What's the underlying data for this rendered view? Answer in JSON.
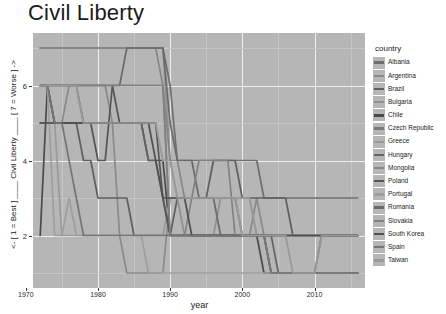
{
  "chart_data": {
    "type": "line",
    "title": "Civil Liberty",
    "xlabel": "year",
    "ylabel": "<- [ 1 = Best ] ____ Civil Liberty ____ [ 7 = Worse ] ->",
    "legend_title": "country",
    "legend_position": "right",
    "grid": true,
    "xlim": [
      1971,
      2017
    ],
    "ylim": [
      0.6,
      7.4
    ],
    "xticks": [
      1970,
      1980,
      1990,
      2000,
      2010
    ],
    "xtick_labels": [
      "1970",
      "1980",
      "1990",
      "2000",
      "2010"
    ],
    "yticks": [
      2,
      4,
      6
    ],
    "ytick_labels": [
      "2",
      "4",
      "6"
    ],
    "panel_bg": "#b6b6b6",
    "grid_color": "#efefef",
    "x": [
      1972,
      1973,
      1974,
      1975,
      1976,
      1977,
      1978,
      1979,
      1980,
      1981,
      1982,
      1983,
      1984,
      1985,
      1986,
      1987,
      1988,
      1989,
      1990,
      1991,
      1992,
      1993,
      1994,
      1995,
      1996,
      1997,
      1998,
      1999,
      2000,
      2001,
      2002,
      2003,
      2004,
      2005,
      2006,
      2007,
      2008,
      2009,
      2010,
      2011,
      2012,
      2013,
      2014,
      2015,
      2016
    ],
    "series": [
      {
        "name": "Albania",
        "color": "#6e6e6e",
        "values": [
          7,
          7,
          7,
          7,
          7,
          7,
          7,
          7,
          7,
          7,
          7,
          7,
          7,
          7,
          7,
          7,
          7,
          7,
          6,
          4,
          4,
          4,
          4,
          4,
          4,
          4,
          4,
          4,
          4,
          4,
          4,
          3,
          3,
          3,
          3,
          3,
          3,
          3,
          3,
          3,
          3,
          3,
          3,
          3,
          3
        ]
      },
      {
        "name": "Argentina",
        "color": "#8a8a8a",
        "values": [
          6,
          6,
          5,
          5,
          6,
          6,
          6,
          6,
          6,
          6,
          5,
          2,
          1,
          1,
          1,
          1,
          1,
          1,
          3,
          3,
          3,
          3,
          3,
          3,
          3,
          3,
          3,
          3,
          2,
          2,
          3,
          2,
          2,
          2,
          2,
          2,
          2,
          2,
          2,
          2,
          2,
          2,
          2,
          2,
          2
        ]
      },
      {
        "name": "Brazil",
        "color": "#5f5f5f",
        "values": [
          5,
          5,
          5,
          5,
          5,
          5,
          4,
          4,
          3,
          3,
          3,
          3,
          3,
          2,
          2,
          2,
          2,
          2,
          2,
          3,
          3,
          3,
          3,
          3,
          4,
          4,
          4,
          4,
          3,
          3,
          3,
          3,
          3,
          3,
          3,
          2,
          2,
          2,
          2,
          2,
          2,
          2,
          2,
          2,
          2
        ]
      },
      {
        "name": "Bulgaria",
        "color": "#909090",
        "values": [
          7,
          7,
          7,
          7,
          7,
          7,
          7,
          7,
          7,
          7,
          7,
          7,
          7,
          7,
          7,
          7,
          7,
          7,
          4,
          3,
          2,
          2,
          2,
          2,
          2,
          3,
          3,
          3,
          3,
          3,
          2,
          2,
          2,
          2,
          2,
          2,
          2,
          2,
          2,
          2,
          2,
          2,
          2,
          2,
          2
        ]
      },
      {
        "name": "Chile",
        "color": "#4a4a4a",
        "values": [
          2,
          6,
          5,
          5,
          5,
          5,
          5,
          5,
          5,
          5,
          5,
          5,
          5,
          5,
          5,
          4,
          4,
          4,
          2,
          2,
          2,
          2,
          2,
          2,
          2,
          2,
          2,
          2,
          2,
          2,
          2,
          1,
          1,
          1,
          1,
          1,
          1,
          1,
          1,
          1,
          1,
          1,
          1,
          1,
          1
        ]
      },
      {
        "name": "Czech Republic",
        "color": "#7a7a7a",
        "values": [
          6,
          6,
          6,
          6,
          6,
          6,
          6,
          6,
          6,
          6,
          6,
          6,
          6,
          6,
          6,
          6,
          6,
          6,
          2,
          2,
          2,
          2,
          2,
          2,
          2,
          2,
          2,
          2,
          2,
          2,
          2,
          2,
          1,
          1,
          1,
          1,
          1,
          1,
          1,
          1,
          1,
          1,
          1,
          1,
          1
        ]
      },
      {
        "name": "Greece",
        "color": "#9a9a9a",
        "values": [
          6,
          6,
          5,
          2,
          2,
          2,
          2,
          2,
          2,
          2,
          2,
          2,
          2,
          2,
          2,
          2,
          2,
          2,
          3,
          3,
          3,
          3,
          3,
          3,
          3,
          3,
          3,
          3,
          3,
          3,
          2,
          2,
          2,
          2,
          2,
          2,
          2,
          2,
          2,
          2,
          2,
          2,
          2,
          2,
          2
        ]
      },
      {
        "name": "Hungary",
        "color": "#646464",
        "values": [
          6,
          6,
          6,
          6,
          6,
          6,
          5,
          5,
          5,
          5,
          5,
          5,
          5,
          5,
          5,
          4,
          4,
          3,
          2,
          2,
          2,
          2,
          2,
          2,
          2,
          2,
          2,
          2,
          2,
          2,
          2,
          2,
          2,
          1,
          1,
          1,
          1,
          1,
          1,
          2,
          2,
          2,
          2,
          2,
          2
        ]
      },
      {
        "name": "Mongolia",
        "color": "#878787",
        "values": [
          7,
          7,
          7,
          7,
          7,
          7,
          7,
          7,
          7,
          7,
          7,
          7,
          7,
          7,
          7,
          7,
          7,
          6,
          4,
          4,
          3,
          3,
          3,
          3,
          3,
          3,
          3,
          3,
          2,
          2,
          2,
          2,
          2,
          2,
          2,
          2,
          2,
          2,
          2,
          2,
          2,
          2,
          2,
          2,
          2
        ]
      },
      {
        "name": "Poland",
        "color": "#555555",
        "values": [
          6,
          6,
          5,
          5,
          5,
          5,
          5,
          5,
          4,
          4,
          6,
          5,
          5,
          5,
          5,
          5,
          5,
          3,
          2,
          2,
          2,
          2,
          2,
          2,
          2,
          2,
          2,
          2,
          2,
          2,
          2,
          2,
          1,
          1,
          1,
          1,
          1,
          1,
          1,
          1,
          1,
          1,
          1,
          1,
          1
        ]
      },
      {
        "name": "Portugal",
        "color": "#9e9e9e",
        "values": [
          6,
          6,
          2,
          2,
          3,
          2,
          2,
          2,
          2,
          2,
          2,
          2,
          2,
          2,
          2,
          1,
          1,
          1,
          1,
          1,
          1,
          1,
          1,
          1,
          1,
          1,
          1,
          1,
          1,
          1,
          1,
          1,
          1,
          1,
          1,
          1,
          1,
          1,
          1,
          1,
          1,
          1,
          1,
          1,
          1
        ]
      },
      {
        "name": "Romania",
        "color": "#6a6a6a",
        "values": [
          6,
          6,
          6,
          6,
          6,
          6,
          6,
          6,
          6,
          6,
          6,
          6,
          7,
          7,
          7,
          7,
          7,
          7,
          5,
          4,
          4,
          4,
          3,
          3,
          3,
          2,
          2,
          2,
          2,
          2,
          2,
          2,
          2,
          2,
          2,
          2,
          2,
          2,
          2,
          2,
          2,
          2,
          2,
          2,
          2
        ]
      },
      {
        "name": "Slovakia",
        "color": "#828282",
        "values": [
          6,
          6,
          6,
          6,
          6,
          6,
          6,
          6,
          6,
          6,
          6,
          6,
          6,
          6,
          6,
          6,
          6,
          6,
          2,
          2,
          2,
          3,
          4,
          4,
          4,
          4,
          4,
          2,
          2,
          2,
          2,
          2,
          1,
          1,
          1,
          1,
          1,
          1,
          1,
          1,
          1,
          1,
          1,
          1,
          1
        ]
      },
      {
        "name": "South Korea",
        "color": "#505050",
        "values": [
          5,
          5,
          5,
          5,
          5,
          5,
          5,
          5,
          5,
          5,
          5,
          5,
          5,
          5,
          5,
          5,
          4,
          3,
          3,
          3,
          3,
          2,
          2,
          2,
          2,
          2,
          2,
          2,
          2,
          2,
          2,
          2,
          2,
          2,
          2,
          2,
          2,
          2,
          2,
          2,
          2,
          2,
          2,
          2,
          2
        ]
      },
      {
        "name": "Spain",
        "color": "#757575",
        "values": [
          6,
          6,
          5,
          5,
          4,
          3,
          2,
          2,
          2,
          2,
          2,
          2,
          2,
          2,
          2,
          2,
          2,
          2,
          2,
          2,
          2,
          2,
          2,
          2,
          2,
          2,
          2,
          2,
          2,
          2,
          2,
          2,
          1,
          1,
          1,
          1,
          1,
          1,
          1,
          1,
          1,
          1,
          1,
          1,
          1
        ]
      },
      {
        "name": "Taiwan",
        "color": "#999999",
        "values": [
          6,
          6,
          6,
          6,
          6,
          6,
          5,
          5,
          5,
          5,
          5,
          5,
          5,
          5,
          5,
          5,
          5,
          4,
          4,
          3,
          3,
          3,
          3,
          3,
          3,
          3,
          3,
          3,
          2,
          2,
          2,
          2,
          2,
          2,
          2,
          1,
          1,
          1,
          1,
          2,
          2,
          2,
          2,
          2,
          2
        ]
      }
    ]
  }
}
